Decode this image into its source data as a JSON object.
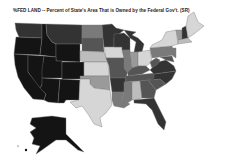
{
  "title": "%FED LAND -- Percent of State's Area That is Owned by the Federal Gov't. (SR)",
  "map": {
    "subject": "Percent of State's Area That is Owned by the Federal Gov't.",
    "palette": {
      "very_high": "#141414",
      "high": "#333333",
      "mid_high": "#555555",
      "mid": "#7a7a7a",
      "mid_low": "#9a9a9a",
      "low": "#bdbdbd",
      "very_low": "#d6d6d6"
    },
    "states": [
      {
        "id": "WA",
        "shade": "high"
      },
      {
        "id": "OR",
        "shade": "very_high"
      },
      {
        "id": "CA",
        "shade": "very_high"
      },
      {
        "id": "NV",
        "shade": "very_high"
      },
      {
        "id": "ID",
        "shade": "very_high"
      },
      {
        "id": "MT",
        "shade": "high"
      },
      {
        "id": "WY",
        "shade": "very_high"
      },
      {
        "id": "UT",
        "shade": "very_high"
      },
      {
        "id": "AZ",
        "shade": "very_high"
      },
      {
        "id": "CO",
        "shade": "very_high"
      },
      {
        "id": "NM",
        "shade": "very_high"
      },
      {
        "id": "ND",
        "shade": "mid"
      },
      {
        "id": "SD",
        "shade": "mid_high"
      },
      {
        "id": "NE",
        "shade": "low"
      },
      {
        "id": "KS",
        "shade": "very_low"
      },
      {
        "id": "OK",
        "shade": "mid_low"
      },
      {
        "id": "TX",
        "shade": "very_low"
      },
      {
        "id": "MN",
        "shade": "high"
      },
      {
        "id": "IA",
        "shade": "very_low"
      },
      {
        "id": "MO",
        "shade": "mid_high"
      },
      {
        "id": "AR",
        "shade": "high"
      },
      {
        "id": "LA",
        "shade": "mid"
      },
      {
        "id": "WI",
        "shade": "high"
      },
      {
        "id": "IL",
        "shade": "mid"
      },
      {
        "id": "MI",
        "shade": "high"
      },
      {
        "id": "IN",
        "shade": "mid_low"
      },
      {
        "id": "OH",
        "shade": "very_low"
      },
      {
        "id": "KY",
        "shade": "mid_high"
      },
      {
        "id": "TN",
        "shade": "mid_high"
      },
      {
        "id": "MS",
        "shade": "mid"
      },
      {
        "id": "AL",
        "shade": "low"
      },
      {
        "id": "GA",
        "shade": "mid_high"
      },
      {
        "id": "FL",
        "shade": "high"
      },
      {
        "id": "SC",
        "shade": "mid_high"
      },
      {
        "id": "NC",
        "shade": "high"
      },
      {
        "id": "VA",
        "shade": "high"
      },
      {
        "id": "WV",
        "shade": "mid_high"
      },
      {
        "id": "PA",
        "shade": "mid"
      },
      {
        "id": "NY",
        "shade": "very_low"
      },
      {
        "id": "VT",
        "shade": "mid_low"
      },
      {
        "id": "NH",
        "shade": "high"
      },
      {
        "id": "ME",
        "shade": "very_low"
      },
      {
        "id": "MA",
        "shade": "low"
      },
      {
        "id": "NJ",
        "shade": "mid"
      },
      {
        "id": "MD",
        "shade": "mid_high"
      },
      {
        "id": "AK",
        "shade": "very_high"
      }
    ]
  }
}
